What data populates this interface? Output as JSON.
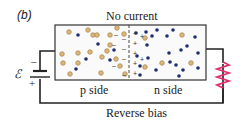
{
  "figure": {
    "label": "(b)",
    "title": "No current",
    "caption": "Reverse bias",
    "p_side_label": "p side",
    "n_side_label": "n side",
    "battery": {
      "symbol": "ℰ",
      "minus": "–",
      "plus": "+"
    },
    "resistor": {
      "color": "#e0306a"
    }
  },
  "colors": {
    "hole": "#d9b77a",
    "hole_stroke": "#a8864f",
    "electron": "#1f2f6e",
    "wire": "#222222",
    "junction": "#333333"
  },
  "junction_charges": {
    "p_side": [
      "–",
      "–",
      "–",
      "–",
      "–",
      "–",
      "–"
    ],
    "n_side": [
      "+",
      "+",
      "+",
      "+",
      "+",
      "+",
      "+"
    ]
  }
}
